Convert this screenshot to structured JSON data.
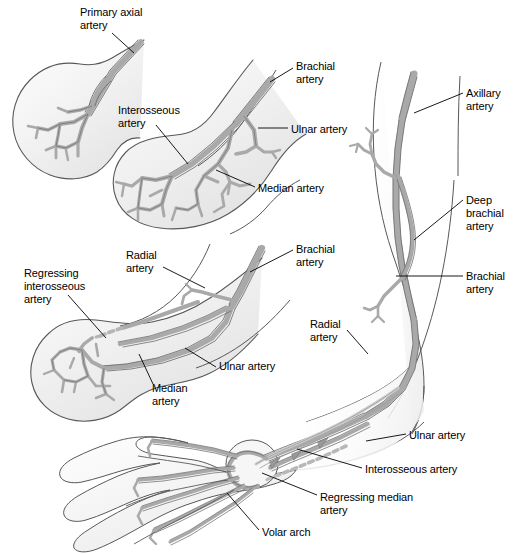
{
  "figure": {
    "background_color": "#ffffff",
    "width": 521,
    "height": 554
  },
  "style": {
    "vessel_fill": "#a9a9a9",
    "vessel_stroke": "#6e6e6e",
    "limb_fill_light": "#fbfbfb",
    "limb_fill_mid": "#ececec",
    "limb_stroke": "#58585a",
    "leader_color": "#000000",
    "text_color": "#000000"
  },
  "labels": [
    {
      "id": "primary-axial-artery",
      "text": "Primary axial\nartery",
      "x": 80,
      "y": 6,
      "align": "left"
    },
    {
      "id": "interosseous-artery-bud",
      "text": "Interosseous\nartery",
      "x": 118,
      "y": 104,
      "align": "left"
    },
    {
      "id": "brachial-artery-bud",
      "text": "Brachial\nartery",
      "x": 296,
      "y": 60,
      "align": "left"
    },
    {
      "id": "ulnar-artery-bud",
      "text": "Ulnar artery",
      "x": 291,
      "y": 123,
      "align": "left"
    },
    {
      "id": "median-artery-bud",
      "text": "Median artery",
      "x": 258,
      "y": 182,
      "align": "left"
    },
    {
      "id": "axillary-artery",
      "text": "Axillary\nartery",
      "x": 466,
      "y": 87,
      "align": "left"
    },
    {
      "id": "deep-brachial-artery",
      "text": "Deep\nbrachial\nartery",
      "x": 466,
      "y": 194,
      "align": "left"
    },
    {
      "id": "brachial-artery-arm",
      "text": "Brachial\nartery",
      "x": 466,
      "y": 270,
      "align": "left"
    },
    {
      "id": "regressing-interosseous-artery",
      "text": "Regressing\ninterosseous\nartery",
      "x": 24,
      "y": 267,
      "align": "left"
    },
    {
      "id": "radial-artery-stage3",
      "text": "Radial\nartery",
      "x": 126,
      "y": 249,
      "align": "left"
    },
    {
      "id": "brachial-artery-stage3",
      "text": "Brachial\nartery",
      "x": 296,
      "y": 243,
      "align": "left"
    },
    {
      "id": "ulnar-artery-stage3",
      "text": "Ulnar artery",
      "x": 219,
      "y": 360,
      "align": "left"
    },
    {
      "id": "median-artery-stage3",
      "text": "Median\nartery",
      "x": 152,
      "y": 382,
      "align": "left"
    },
    {
      "id": "radial-artery-arm",
      "text": "Radial\nartery",
      "x": 310,
      "y": 318,
      "align": "left"
    },
    {
      "id": "ulnar-artery-arm",
      "text": "Ulnar artery",
      "x": 409,
      "y": 429,
      "align": "left"
    },
    {
      "id": "interosseous-artery-arm",
      "text": "Interosseous artery",
      "x": 365,
      "y": 463,
      "align": "left"
    },
    {
      "id": "regressing-median-artery",
      "text": "Regressing median\nartery",
      "x": 320,
      "y": 491,
      "align": "left"
    },
    {
      "id": "volar-arch",
      "text": "Volar arch",
      "x": 262,
      "y": 526,
      "align": "left"
    }
  ],
  "leaders": [
    {
      "id": "leader-primary-axial-artery",
      "points": "112,33 134,53"
    },
    {
      "id": "leader-interosseous-artery-bud",
      "points": "156,125 188,164"
    },
    {
      "id": "leader-brachial-artery-bud",
      "points": "293,68 270,82"
    },
    {
      "id": "leader-ulnar-artery-bud",
      "points": "288,128 258,128"
    },
    {
      "id": "leader-median-artery-bud",
      "points": "255,187 215,170"
    },
    {
      "id": "leader-axillary-artery",
      "points": "463,93 414,113"
    },
    {
      "id": "leader-deep-brachial-artery",
      "points": "463,200 414,240"
    },
    {
      "id": "leader-brachial-artery-arm",
      "points": "463,276 396,276"
    },
    {
      "id": "leader-regressing-interosseous-artery",
      "points": "68,295 106,338"
    },
    {
      "id": "leader-radial-artery-stage3",
      "points": "163,267 205,288"
    },
    {
      "id": "leader-brachial-artery-stage3",
      "points": "293,250 250,272"
    },
    {
      "id": "leader-ulnar-artery-stage3",
      "points": "216,367 185,348"
    },
    {
      "id": "leader-median-artery-stage3",
      "points": "153,384 139,354"
    },
    {
      "id": "leader-radial-artery-arm",
      "points": "347,330 368,354"
    },
    {
      "id": "leader-ulnar-artery-arm",
      "points": "406,434 366,441"
    },
    {
      "id": "leader-interosseous-artery-arm",
      "points": "362,468 297,449"
    },
    {
      "id": "leader-regressing-median-artery",
      "points": "317,495 262,473"
    },
    {
      "id": "leader-volar-arch",
      "points": "259,530 227,493"
    }
  ],
  "panels": [
    {
      "id": "panel-stage-1",
      "name": "early-limb-bud-primary-axial-artery"
    },
    {
      "id": "panel-stage-2",
      "name": "limb-bud-interosseous-median-ulnar"
    },
    {
      "id": "panel-stage-3",
      "name": "limb-bud-radial-regressing-interosseous"
    },
    {
      "id": "panel-adult-arm",
      "name": "mature-upper-limb-arterial-pattern"
    }
  ]
}
